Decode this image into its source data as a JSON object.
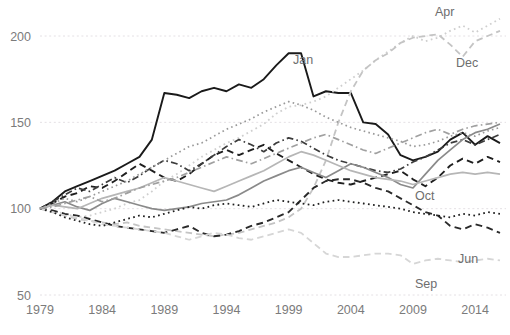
{
  "chart_data": {
    "type": "line",
    "title": "",
    "subtitle": "",
    "xlabel": "",
    "ylabel": "",
    "xlim": [
      1979,
      2016
    ],
    "ylim": [
      50,
      205
    ],
    "yticks": [
      50,
      100,
      150,
      200
    ],
    "xticks": [
      1979,
      1984,
      1989,
      1994,
      1999,
      2004,
      2009,
      2014
    ],
    "grid": "horizontal-dotted",
    "legend_position": "inline-labels",
    "baseline_note": "all series indexed to 100 in 1979",
    "colors": {
      "grid": "#e4e0e4",
      "tick_text": "#7b7b7b",
      "label_text": "#6e6e6e",
      "dark": "#1a1a1a",
      "mid": "#6b6b6b",
      "light": "#bdbdbd",
      "pale": "#d2d2d2"
    },
    "x": [
      1979,
      1980,
      1981,
      1982,
      1983,
      1984,
      1985,
      1986,
      1987,
      1988,
      1989,
      1990,
      1991,
      1992,
      1993,
      1994,
      1995,
      1996,
      1997,
      1998,
      1999,
      2000,
      2001,
      2002,
      2003,
      2004,
      2005,
      2006,
      2007,
      2008,
      2009,
      2010,
      2011,
      2012,
      2013,
      2014,
      2015,
      2016
    ],
    "series": [
      {
        "name": "Jan",
        "label": "Jan",
        "label_x": 293,
        "label_y": 64,
        "style": "solid",
        "color": "#1a1a1a",
        "width": 1.9,
        "values": [
          100,
          104,
          110,
          113,
          116,
          119,
          122,
          126,
          130,
          140,
          167,
          166,
          164,
          168,
          170,
          168,
          172,
          170,
          175,
          183,
          190,
          190,
          165,
          168,
          167,
          167,
          150,
          149,
          143,
          131,
          128,
          130,
          133,
          140,
          144,
          137,
          142,
          138
        ]
      },
      {
        "name": "Apr",
        "label": "Apr",
        "label_x": 435,
        "label_y": 16,
        "style": "dotted",
        "color": "#cfcfcf",
        "width": 1.8,
        "values": [
          100,
          99,
          97,
          95,
          96,
          98,
          100,
          103,
          105,
          110,
          116,
          120,
          125,
          130,
          134,
          138,
          141,
          145,
          149,
          155,
          159,
          160,
          162,
          165,
          170,
          175,
          180,
          186,
          191,
          196,
          200,
          197,
          199,
          203,
          206,
          202,
          206,
          210
        ]
      },
      {
        "name": "Dec",
        "label": "Dec",
        "label_x": 456,
        "label_y": 67,
        "style": "dashed",
        "color": "#c4c4c4",
        "width": 1.8,
        "values": [
          100,
          98,
          96,
          94,
          93,
          92,
          91,
          92,
          90,
          89,
          88,
          87,
          86,
          85,
          84,
          85,
          86,
          88,
          90,
          92,
          95,
          100,
          112,
          128,
          150,
          168,
          180,
          186,
          190,
          196,
          199,
          200,
          201,
          195,
          188,
          197,
          200,
          203
        ]
      },
      {
        "name": "Oct",
        "label": "Oct",
        "label_x": 415,
        "label_y": 200,
        "style": "dashed",
        "color": "#1f1f1f",
        "width": 1.9,
        "values": [
          100,
          103,
          107,
          109,
          113,
          112,
          116,
          121,
          126,
          122,
          118,
          116,
          120,
          126,
          131,
          134,
          131,
          134,
          137,
          132,
          128,
          124,
          120,
          117,
          115,
          114,
          116,
          118,
          120,
          122,
          117,
          113,
          118,
          125,
          129,
          126,
          130,
          127
        ]
      },
      {
        "name": "Jun",
        "label": "Jun",
        "label_x": 458,
        "label_y": 263,
        "style": "dashed",
        "color": "#2a2a2a",
        "width": 1.9,
        "values": [
          100,
          99,
          97,
          96,
          94,
          92,
          90,
          89,
          88,
          87,
          86,
          88,
          90,
          86,
          84,
          85,
          87,
          90,
          92,
          95,
          98,
          105,
          112,
          116,
          117,
          117,
          115,
          112,
          110,
          106,
          102,
          98,
          96,
          90,
          88,
          91,
          89,
          86
        ]
      },
      {
        "name": "Sep",
        "label": "Sep",
        "label_x": 415,
        "label_y": 288,
        "style": "dashed",
        "color": "#d6d6d6",
        "width": 1.8,
        "values": [
          100,
          98,
          96,
          95,
          93,
          91,
          90,
          89,
          88,
          87,
          86,
          84,
          82,
          84,
          86,
          85,
          83,
          82,
          84,
          86,
          88,
          86,
          80,
          74,
          72,
          72,
          73,
          74,
          74,
          73,
          68,
          70,
          71,
          70,
          69,
          70,
          71,
          70
        ]
      },
      {
        "name": "Feb",
        "label": "",
        "label_x": 0,
        "label_y": 0,
        "style": "dash-dot",
        "color": "#3c3c3c",
        "width": 1.7,
        "values": [
          100,
          104,
          108,
          112,
          110,
          114,
          118,
          115,
          119,
          124,
          128,
          126,
          122,
          126,
          131,
          136,
          140,
          137,
          133,
          138,
          141,
          139,
          135,
          131,
          128,
          126,
          124,
          122,
          121,
          123,
          127,
          130,
          134,
          138,
          140,
          137,
          140,
          143
        ]
      },
      {
        "name": "Mar",
        "label": "",
        "label_x": 0,
        "label_y": 0,
        "style": "solid",
        "color": "#8a8a8a",
        "width": 1.7,
        "values": [
          100,
          102,
          104,
          101,
          99,
          103,
          106,
          104,
          102,
          100,
          99,
          100,
          101,
          103,
          104,
          105,
          108,
          112,
          116,
          119,
          122,
          124,
          121,
          118,
          122,
          126,
          124,
          121,
          118,
          114,
          112,
          120,
          128,
          134,
          140,
          144,
          146,
          149
        ]
      },
      {
        "name": "May",
        "label": "",
        "label_x": 0,
        "label_y": 0,
        "style": "dotted",
        "color": "#999999",
        "width": 1.7,
        "values": [
          100,
          103,
          106,
          104,
          107,
          110,
          113,
          116,
          120,
          124,
          128,
          132,
          136,
          138,
          142,
          146,
          149,
          152,
          156,
          159,
          162,
          160,
          157,
          153,
          150,
          147,
          145,
          143,
          141,
          139,
          136,
          137,
          139,
          142,
          144,
          142,
          145,
          147
        ]
      },
      {
        "name": "Jul",
        "label": "",
        "label_x": 0,
        "label_y": 0,
        "style": "dotted",
        "color": "#1f1f1f",
        "width": 1.8,
        "values": [
          100,
          98,
          95,
          93,
          91,
          90,
          92,
          94,
          96,
          95,
          97,
          99,
          101,
          100,
          102,
          103,
          102,
          101,
          103,
          105,
          104,
          103,
          102,
          104,
          105,
          104,
          103,
          102,
          101,
          100,
          98,
          97,
          96,
          95,
          97,
          96,
          98,
          97
        ]
      },
      {
        "name": "Aug",
        "label": "",
        "label_x": 0,
        "label_y": 0,
        "style": "solid",
        "color": "#b6b6b6",
        "width": 1.7,
        "values": [
          100,
          102,
          101,
          100,
          103,
          106,
          108,
          110,
          112,
          115,
          118,
          116,
          114,
          112,
          110,
          113,
          116,
          119,
          122,
          126,
          130,
          133,
          131,
          128,
          125,
          122,
          120,
          118,
          117,
          116,
          114,
          116,
          118,
          120,
          121,
          120,
          121,
          120
        ]
      },
      {
        "name": "Nov",
        "label": "",
        "label_x": 0,
        "label_y": 0,
        "style": "dash-dot",
        "color": "#a0a0a0",
        "width": 1.7,
        "values": [
          100,
          101,
          103,
          105,
          107,
          104,
          106,
          109,
          112,
          114,
          116,
          118,
          121,
          124,
          127,
          130,
          128,
          126,
          129,
          132,
          135,
          138,
          141,
          143,
          140,
          137,
          134,
          132,
          135,
          138,
          141,
          144,
          146,
          143,
          146,
          148,
          149,
          150
        ]
      }
    ]
  },
  "axis": {
    "ytick_labels": [
      "200",
      "150",
      "100",
      "50"
    ],
    "xtick_labels": [
      "1979",
      "1984",
      "1989",
      "1994",
      "1999",
      "2004",
      "2009",
      "2014"
    ]
  }
}
